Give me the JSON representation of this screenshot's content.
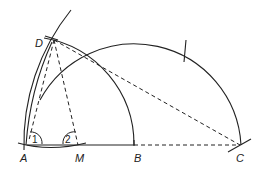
{
  "diagram": {
    "type": "geometric construction",
    "points": [
      {
        "id": "A",
        "label": "A"
      },
      {
        "id": "M",
        "label": "M"
      },
      {
        "id": "B",
        "label": "B"
      },
      {
        "id": "C",
        "label": "C"
      },
      {
        "id": "D",
        "label": "D"
      }
    ],
    "angle_markers": [
      {
        "label": "1",
        "at": "A"
      },
      {
        "label": "2",
        "at": "M"
      }
    ],
    "stroke_color": "#222222",
    "background_color": "#ffffff"
  }
}
